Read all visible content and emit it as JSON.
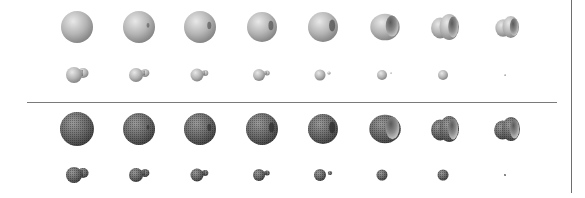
{
  "figure": {
    "columns": 8,
    "column_x": [
      77,
      139,
      200,
      262,
      323,
      385,
      446,
      508
    ],
    "panels": [
      {
        "name": "smooth-shaded",
        "style": "smooth",
        "large_row_y": 27,
        "small_row_y": 75,
        "large_shapes": [
          {
            "kind": "sphere",
            "r": 16,
            "dimple": 0
          },
          {
            "kind": "sphere",
            "r": 16,
            "dimple": 0.15
          },
          {
            "kind": "sphere",
            "r": 16,
            "dimple": 0.3
          },
          {
            "kind": "sphere",
            "r": 15,
            "dimple": 0.45
          },
          {
            "kind": "sphere",
            "r": 15,
            "dimple": 0.6
          },
          {
            "kind": "cup",
            "r": 14,
            "dimple": 0.8
          },
          {
            "kind": "cup2",
            "r": 13,
            "dimple": 1
          },
          {
            "kind": "cup2",
            "r": 11,
            "dimple": 1
          }
        ],
        "small_shapes": [
          {
            "body_r": 8,
            "tail_r": 5,
            "tail_dx": 9
          },
          {
            "body_r": 7,
            "tail_r": 4,
            "tail_dx": 9
          },
          {
            "body_r": 6.5,
            "tail_r": 3,
            "tail_dx": 8
          },
          {
            "body_r": 6,
            "tail_r": 2.5,
            "tail_dx": 8
          },
          {
            "body_r": 5.5,
            "tail_r": 1.5,
            "tail_dx": 9
          },
          {
            "body_r": 5,
            "tail_r": 0.8,
            "tail_dx": 9
          },
          {
            "body_r": 5,
            "tail_r": 0,
            "tail_dx": 0
          },
          {
            "body_r": 1,
            "tail_r": 0,
            "tail_dx": 0
          }
        ]
      },
      {
        "name": "mesh-rendered",
        "style": "mesh",
        "large_row_y": 129,
        "small_row_y": 175,
        "large_shapes": [
          {
            "kind": "sphere",
            "r": 17,
            "dimple": 0
          },
          {
            "kind": "sphere",
            "r": 16,
            "dimple": 0.15
          },
          {
            "kind": "sphere",
            "r": 16,
            "dimple": 0.3
          },
          {
            "kind": "sphere",
            "r": 16,
            "dimple": 0.45
          },
          {
            "kind": "sphere",
            "r": 15,
            "dimple": 0.6
          },
          {
            "kind": "cup",
            "r": 15,
            "dimple": 0.8
          },
          {
            "kind": "cup2",
            "r": 13,
            "dimple": 1
          },
          {
            "kind": "cup2",
            "r": 12,
            "dimple": 1
          }
        ],
        "small_shapes": [
          {
            "body_r": 8,
            "tail_r": 5,
            "tail_dx": 9
          },
          {
            "body_r": 7,
            "tail_r": 4,
            "tail_dx": 9
          },
          {
            "body_r": 6.5,
            "tail_r": 3,
            "tail_dx": 8
          },
          {
            "body_r": 6,
            "tail_r": 2.5,
            "tail_dx": 8
          },
          {
            "body_r": 6,
            "tail_r": 2,
            "tail_dx": 10
          },
          {
            "body_r": 5.5,
            "tail_r": 0,
            "tail_dx": 0
          },
          {
            "body_r": 5.5,
            "tail_r": 0,
            "tail_dx": 0
          },
          {
            "body_r": 1,
            "tail_r": 0,
            "tail_dx": 0
          }
        ]
      }
    ],
    "colors": {
      "smooth_light": "#e8e8e8",
      "smooth_mid": "#b4b4b4",
      "smooth_dark": "#7c7c7c",
      "mesh_light": "#9a9a9a",
      "mesh_mid": "#6a6a6a",
      "mesh_dark": "#3c3c3c",
      "separator": "#7a7a7a"
    }
  }
}
